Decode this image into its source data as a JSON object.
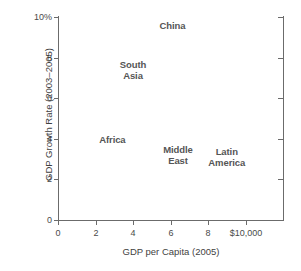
{
  "chart_data": {
    "type": "scatter",
    "title": "",
    "subtitle": "",
    "xlabel": "GDP per Capita (2005)",
    "ylabel": "GDP Growth Rate (2003–2005)",
    "xlim": [
      0,
      12
    ],
    "ylim": [
      0,
      10
    ],
    "grid": false,
    "legend": "none",
    "marker_style": "text-labels-only",
    "xticks": [
      {
        "value": 0,
        "label": "0"
      },
      {
        "value": 2,
        "label": "2"
      },
      {
        "value": 4,
        "label": "4"
      },
      {
        "value": 6,
        "label": "6"
      },
      {
        "value": 8,
        "label": "8"
      },
      {
        "value": 10,
        "label": "$10,000"
      }
    ],
    "yticks": [
      {
        "value": 0,
        "label": "0"
      },
      {
        "value": 2,
        "label": "2"
      },
      {
        "value": 4,
        "label": "4"
      },
      {
        "value": 6,
        "label": "6"
      },
      {
        "value": 8,
        "label": "8"
      },
      {
        "value": 10,
        "label": "10%"
      }
    ],
    "right_axis_ticks": [
      2,
      4,
      6,
      8,
      10
    ],
    "points": [
      {
        "label": "China",
        "x": 6.1,
        "y": 9.6
      },
      {
        "label": "South\nAsia",
        "x": 4.0,
        "y": 7.4
      },
      {
        "label": "Africa",
        "x": 2.9,
        "y": 4.0
      },
      {
        "label": "Middle\nEast",
        "x": 6.4,
        "y": 3.2
      },
      {
        "label": "Latin\nAmerica",
        "x": 9.0,
        "y": 3.1
      }
    ],
    "colors": {
      "background": "#ffffff",
      "axis": "#6b6b6b",
      "tick_text": "#4a4a4a",
      "axis_title": "#3f3f3f",
      "point_label": "#555555"
    }
  }
}
